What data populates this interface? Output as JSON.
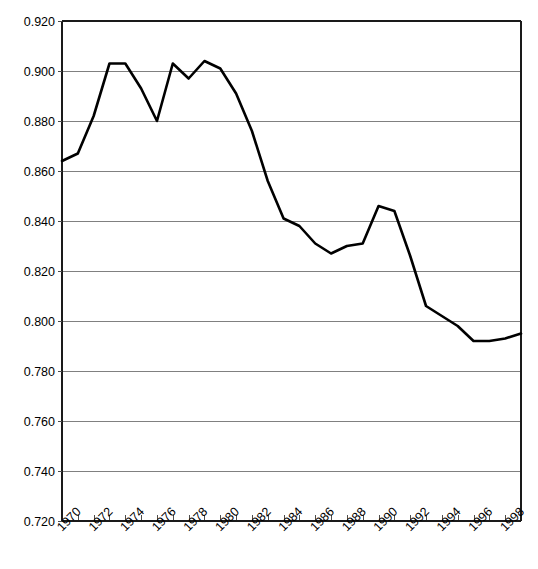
{
  "chart_data": {
    "type": "line",
    "title": "",
    "subtitle": "",
    "xlabel": "",
    "ylabel": "",
    "xlim": [
      1970,
      1999
    ],
    "ylim": [
      0.72,
      0.92
    ],
    "grid": true,
    "legend": "none",
    "y_ticks": [
      "0.920",
      "0.900",
      "0.880",
      "0.860",
      "0.840",
      "0.820",
      "0.800",
      "0.780",
      "0.760",
      "0.740",
      "0.720"
    ],
    "y_tick_values": [
      0.92,
      0.9,
      0.88,
      0.86,
      0.84,
      0.82,
      0.8,
      0.78,
      0.76,
      0.74,
      0.72
    ],
    "x_tick_labels": [
      "1970",
      "1972",
      "1974",
      "1976",
      "1978",
      "1980",
      "1982",
      "1984",
      "1986",
      "1988",
      "1990",
      "1992",
      "1994",
      "1996",
      "1998"
    ],
    "x_tick_values": [
      1970,
      1972,
      1974,
      1976,
      1978,
      1980,
      1982,
      1984,
      1986,
      1988,
      1990,
      1992,
      1994,
      1996,
      1998
    ],
    "x": [
      1970,
      1971,
      1972,
      1973,
      1974,
      1975,
      1976,
      1977,
      1978,
      1979,
      1980,
      1981,
      1982,
      1983,
      1984,
      1985,
      1986,
      1987,
      1988,
      1989,
      1990,
      1991,
      1992,
      1993,
      1994,
      1995,
      1996,
      1997,
      1998,
      1999
    ],
    "series": [
      {
        "name": "series-1",
        "color": "#000000",
        "values": [
          0.864,
          0.867,
          0.882,
          0.903,
          0.903,
          0.893,
          0.88,
          0.903,
          0.897,
          0.904,
          0.901,
          0.891,
          0.876,
          0.856,
          0.841,
          0.838,
          0.831,
          0.827,
          0.83,
          0.831,
          0.846,
          0.844,
          0.826,
          0.806,
          0.802,
          0.798,
          0.792,
          0.792,
          0.793,
          0.795
        ]
      }
    ],
    "colors": {
      "line": "#000000",
      "grid": "#808080",
      "axis": "#1a1a1a",
      "background": "#ffffff"
    }
  }
}
